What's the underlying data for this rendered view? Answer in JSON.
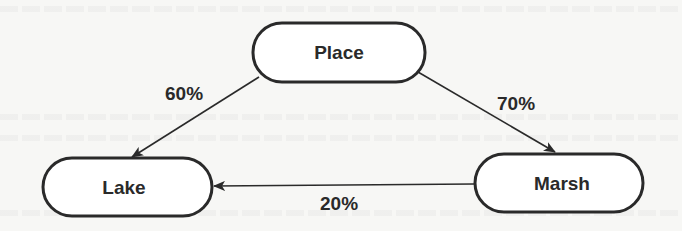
{
  "diagram": {
    "type": "flow",
    "nodes": [
      {
        "id": "place",
        "label": "Place"
      },
      {
        "id": "lake",
        "label": "Lake"
      },
      {
        "id": "marsh",
        "label": "Marsh"
      }
    ],
    "edges": [
      {
        "from": "place",
        "to": "lake",
        "label": "60%"
      },
      {
        "from": "place",
        "to": "marsh",
        "label": "70%"
      },
      {
        "from": "marsh",
        "to": "lake",
        "label": "20%"
      }
    ],
    "colors": {
      "stroke": "#2a2a2a",
      "background": "#f7f7f5",
      "node_fill": "#ffffff"
    }
  }
}
